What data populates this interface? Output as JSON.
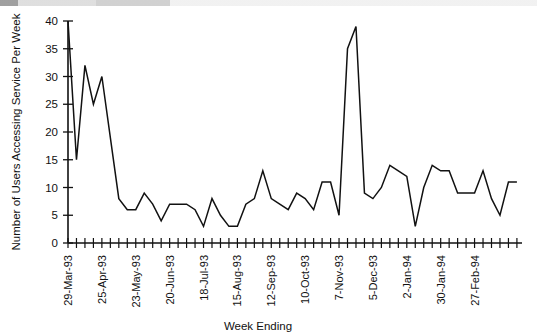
{
  "chart_data": {
    "type": "line",
    "title": "",
    "xlabel": "Week Ending",
    "ylabel": "Number of Users Accessing Service Per Week",
    "ylim": [
      0,
      40
    ],
    "yticks": [
      0,
      5,
      10,
      15,
      20,
      25,
      30,
      35,
      40
    ],
    "grid": false,
    "legend": "none",
    "xtick_labels": [
      "29-Mar-93",
      "25-Apr-93",
      "23-May-93",
      "20-Jun-93",
      "18-Jul-93",
      "15-Aug-93",
      "12-Sep-93",
      "10-Oct-93",
      "7-Nov-93",
      "5-Dec-93",
      "2-Jan-94",
      "30-Jan-94",
      "27-Feb-94"
    ],
    "xtick_label_interval_weeks": 4,
    "n_points": 54,
    "series": [
      {
        "name": "Users accessing service per week",
        "color": "#111111",
        "values": [
          40,
          15,
          32,
          25,
          30,
          19,
          8,
          6,
          6,
          9,
          7,
          4,
          7,
          7,
          7,
          6,
          3,
          8,
          5,
          3,
          3,
          7,
          8,
          13,
          8,
          7,
          6,
          9,
          8,
          6,
          11,
          11,
          5,
          35,
          39,
          9,
          8,
          10,
          14,
          13,
          12,
          3,
          10,
          14,
          13,
          13,
          9,
          9,
          9,
          13,
          8,
          5,
          11,
          11
        ]
      }
    ]
  }
}
